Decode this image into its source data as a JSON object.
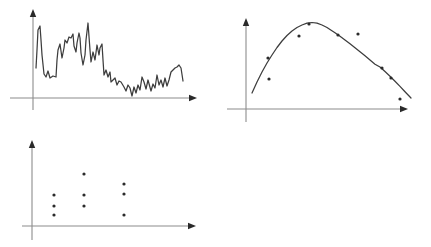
{
  "canvas": {
    "width": 431,
    "height": 247,
    "background": "#ffffff"
  },
  "style": {
    "axis_color": "#8c8c8c",
    "ink_color": "#3d3d3d",
    "dot_color": "#2b2b2b",
    "arrow_color": "#2a2a2a",
    "line_width": 1.25,
    "axis_width": 1.1,
    "dot_radius": 1.6
  },
  "chart_data": [
    {
      "type": "line",
      "id": "noisy-line-sketch",
      "title": "",
      "xlabel": "",
      "ylabel": "",
      "description": "hand-drawn jagged noisy line, high variance at left settling lower to the right, unlabeled axes with arrowheads",
      "coordinate_space": "screenshot pixels",
      "axes_px": {
        "x_axis": {
          "y": 98,
          "x1": 10,
          "x2": 197
        },
        "y_axis": {
          "x": 33,
          "y1": 110,
          "y2": 9
        }
      },
      "line_points_px": [
        [
          36,
          68
        ],
        [
          37,
          50
        ],
        [
          38,
          30
        ],
        [
          40,
          26
        ],
        [
          41,
          40
        ],
        [
          42,
          55
        ],
        [
          44,
          74
        ],
        [
          46,
          77
        ],
        [
          48,
          71
        ],
        [
          50,
          78
        ],
        [
          53,
          76
        ],
        [
          56,
          77
        ],
        [
          57,
          60
        ],
        [
          58,
          50
        ],
        [
          60,
          44
        ],
        [
          62,
          58
        ],
        [
          64,
          48
        ],
        [
          65,
          40
        ],
        [
          67,
          43
        ],
        [
          69,
          37
        ],
        [
          71,
          38
        ],
        [
          73,
          34
        ],
        [
          74,
          46
        ],
        [
          76,
          52
        ],
        [
          77,
          43
        ],
        [
          79,
          33
        ],
        [
          80,
          38
        ],
        [
          81,
          53
        ],
        [
          83,
          65
        ],
        [
          85,
          55
        ],
        [
          86,
          40
        ],
        [
          88,
          23
        ],
        [
          90,
          50
        ],
        [
          91,
          62
        ],
        [
          93,
          52
        ],
        [
          95,
          60
        ],
        [
          97,
          45
        ],
        [
          99,
          55
        ],
        [
          100,
          48
        ],
        [
          102,
          44
        ],
        [
          103,
          60
        ],
        [
          104,
          75
        ],
        [
          106,
          70
        ],
        [
          108,
          77
        ],
        [
          110,
          72
        ],
        [
          111,
          82
        ],
        [
          113,
          80
        ],
        [
          115,
          78
        ],
        [
          117,
          85
        ],
        [
          119,
          81
        ],
        [
          121,
          82
        ],
        [
          124,
          87
        ],
        [
          126,
          91
        ],
        [
          128,
          85
        ],
        [
          130,
          88
        ],
        [
          132,
          96
        ],
        [
          134,
          87
        ],
        [
          136,
          93
        ],
        [
          138,
          85
        ],
        [
          140,
          90
        ],
        [
          142,
          77
        ],
        [
          144,
          82
        ],
        [
          146,
          89
        ],
        [
          148,
          80
        ],
        [
          151,
          91
        ],
        [
          153,
          84
        ],
        [
          155,
          88
        ],
        [
          157,
          75
        ],
        [
          159,
          85
        ],
        [
          161,
          80
        ],
        [
          163,
          87
        ],
        [
          165,
          78
        ],
        [
          167,
          86
        ],
        [
          169,
          80
        ],
        [
          171,
          72
        ],
        [
          173,
          70
        ],
        [
          175,
          68
        ],
        [
          177,
          67
        ],
        [
          179,
          65
        ],
        [
          181,
          68
        ],
        [
          183,
          81
        ]
      ]
    },
    {
      "type": "scatter",
      "id": "scatter-with-fitted-curve",
      "title": "",
      "xlabel": "",
      "ylabel": "",
      "description": "scatter points with a smooth fitted arch (rise then fall) curve, unlabeled axes with arrowheads",
      "coordinate_space": "screenshot pixels",
      "axes_px": {
        "x_axis": {
          "y": 109,
          "x1": 227,
          "x2": 408
        },
        "y_axis": {
          "x": 246,
          "y1": 122,
          "y2": 18
        }
      },
      "curve_points_px": [
        [
          252,
          93
        ],
        [
          257,
          82
        ],
        [
          262,
          72
        ],
        [
          267,
          63
        ],
        [
          272,
          55
        ],
        [
          277,
          47.5
        ],
        [
          282,
          41
        ],
        [
          287,
          35.5
        ],
        [
          292,
          31
        ],
        [
          297,
          27.5
        ],
        [
          302,
          25
        ],
        [
          307,
          23.2
        ],
        [
          312,
          22.5
        ],
        [
          317,
          23.2
        ],
        [
          322,
          25
        ],
        [
          327,
          27.5
        ],
        [
          330,
          29.5
        ],
        [
          335,
          32.8
        ],
        [
          340,
          36.3
        ],
        [
          345,
          40
        ],
        [
          350,
          43.8
        ],
        [
          355,
          47.7
        ],
        [
          360,
          51.7
        ],
        [
          365,
          55.8
        ],
        [
          370,
          60
        ],
        [
          375,
          64.2
        ],
        [
          380,
          67
        ],
        [
          385,
          71.5
        ],
        [
          390,
          76.2
        ],
        [
          395,
          81.2
        ],
        [
          400,
          86.4
        ],
        [
          405,
          91.7
        ],
        [
          411,
          98
        ]
      ],
      "scatter_points_px": [
        [
          268,
          58
        ],
        [
          269,
          79
        ],
        [
          299,
          36
        ],
        [
          309,
          24
        ],
        [
          338,
          35
        ],
        [
          358,
          34
        ],
        [
          382,
          68
        ],
        [
          391,
          78
        ],
        [
          400,
          99
        ]
      ]
    },
    {
      "type": "scatter",
      "id": "column-scatter",
      "title": "",
      "xlabel": "",
      "ylabel": "",
      "description": "nine dots arranged in three vertical columns, unlabeled axes with arrowheads",
      "coordinate_space": "screenshot pixels",
      "axes_px": {
        "x_axis": {
          "y": 226,
          "x1": 22,
          "x2": 196
        },
        "y_axis": {
          "x": 32,
          "y1": 240,
          "y2": 140
        }
      },
      "scatter_points_px": [
        [
          54,
          195
        ],
        [
          54,
          206
        ],
        [
          54,
          215
        ],
        [
          84,
          174
        ],
        [
          84,
          195
        ],
        [
          84,
          206
        ],
        [
          124,
          184
        ],
        [
          124,
          194
        ],
        [
          124,
          215
        ]
      ]
    }
  ]
}
